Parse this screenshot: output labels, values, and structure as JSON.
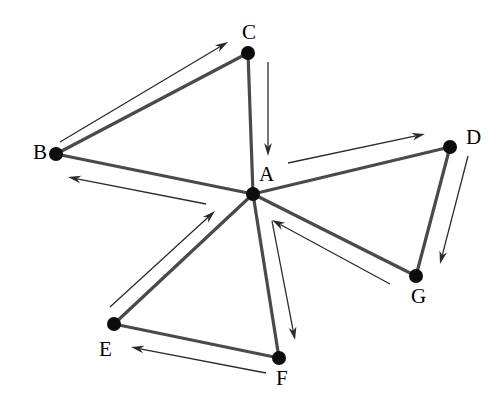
{
  "figure": {
    "type": "directed-graph-diagram",
    "background_color": "#ffffff",
    "edge_color": "#4a4a4a",
    "arrow_color": "#2b2b2b",
    "node_color": "#0d0d0d",
    "width": 502,
    "height": 404
  },
  "nodes": [
    {
      "id": "A",
      "label": "A",
      "x": 253,
      "y": 194,
      "r": 7,
      "label_x": 259,
      "label_y": 164
    },
    {
      "id": "B",
      "label": "B",
      "x": 56,
      "y": 154,
      "r": 7,
      "label_x": 33,
      "label_y": 142
    },
    {
      "id": "C",
      "label": "C",
      "x": 248,
      "y": 53,
      "r": 7,
      "label_x": 242,
      "label_y": 22
    },
    {
      "id": "D",
      "label": "D",
      "x": 450,
      "y": 147,
      "r": 7,
      "label_x": 466,
      "label_y": 127
    },
    {
      "id": "E",
      "label": "E",
      "x": 114,
      "y": 324,
      "r": 7,
      "label_x": 99,
      "label_y": 339
    },
    {
      "id": "F",
      "label": "F",
      "x": 279,
      "y": 358,
      "r": 7,
      "label_x": 276,
      "label_y": 368
    },
    {
      "id": "G",
      "label": "G",
      "x": 416,
      "y": 276,
      "r": 7,
      "label_x": 411,
      "label_y": 286
    }
  ],
  "edges": [
    {
      "id": "edge-b-c",
      "from": "B",
      "to": "C"
    },
    {
      "id": "edge-c-a",
      "from": "C",
      "to": "A"
    },
    {
      "id": "edge-b-a",
      "from": "B",
      "to": "A"
    },
    {
      "id": "edge-a-d",
      "from": "A",
      "to": "D"
    },
    {
      "id": "edge-d-g",
      "from": "D",
      "to": "G"
    },
    {
      "id": "edge-g-a",
      "from": "G",
      "to": "A"
    },
    {
      "id": "edge-a-e",
      "from": "A",
      "to": "E"
    },
    {
      "id": "edge-e-f",
      "from": "E",
      "to": "F"
    },
    {
      "id": "edge-f-a",
      "from": "F",
      "to": "A"
    }
  ],
  "arrows": [
    {
      "id": "arrow-b-to-c",
      "from": "B",
      "to": "C",
      "x1": 60,
      "y1": 142,
      "x2": 228,
      "y2": 42
    },
    {
      "id": "arrow-c-to-a",
      "from": "C",
      "to": "A",
      "x1": 268,
      "y1": 62,
      "x2": 268,
      "y2": 156
    },
    {
      "id": "arrow-a-to-b",
      "from": "A",
      "to": "B",
      "x1": 206,
      "y1": 204,
      "x2": 68,
      "y2": 177
    },
    {
      "id": "arrow-a-to-d",
      "from": "A",
      "to": "D",
      "x1": 288,
      "y1": 163,
      "x2": 425,
      "y2": 134
    },
    {
      "id": "arrow-d-to-g",
      "from": "D",
      "to": "G",
      "x1": 468,
      "y1": 156,
      "x2": 440,
      "y2": 264
    },
    {
      "id": "arrow-g-to-a",
      "from": "G",
      "to": "A",
      "x1": 390,
      "y1": 284,
      "x2": 272,
      "y2": 220
    },
    {
      "id": "arrow-a-to-f",
      "from": "A",
      "to": "F",
      "x1": 272,
      "y1": 221,
      "x2": 295,
      "y2": 340
    },
    {
      "id": "arrow-e-to-a",
      "from": "E",
      "to": "A",
      "x1": 110,
      "y1": 307,
      "x2": 215,
      "y2": 211
    },
    {
      "id": "arrow-f-to-e",
      "from": "F",
      "to": "E",
      "x1": 266,
      "y1": 373,
      "x2": 131,
      "y2": 347
    }
  ]
}
